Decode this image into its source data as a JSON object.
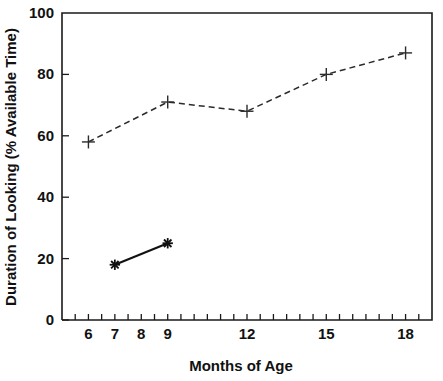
{
  "chart_data": {
    "type": "line",
    "title": "",
    "xlabel": "Months of Age",
    "ylabel": "Duration of Looking (% Available Time)",
    "xlim": [
      5,
      19
    ],
    "ylim": [
      0,
      100
    ],
    "grid": false,
    "legend": "none",
    "x_tick_labels": [
      "6",
      "7",
      "8",
      "9",
      "12",
      "15",
      "18"
    ],
    "x_tick_values": [
      6,
      7,
      8,
      9,
      12,
      15,
      18
    ],
    "x_minor_ticks": [
      5.5,
      6,
      6.5,
      7,
      7.5,
      8,
      8.5,
      9,
      9.5,
      10,
      10.5,
      11,
      11.5,
      12,
      12.5,
      13,
      13.5,
      14,
      14.5,
      15,
      15.5,
      16,
      16.5,
      17,
      17.5,
      18,
      18.5
    ],
    "y_tick_labels": [
      "0",
      "20",
      "40",
      "60",
      "80",
      "100"
    ],
    "y_tick_values": [
      0,
      20,
      40,
      60,
      80,
      100
    ],
    "series": [
      {
        "name": "dashed-series",
        "style": "dashed",
        "marker": "plus",
        "color": "#2b2b2b",
        "x": [
          6,
          9,
          12,
          15,
          18
        ],
        "values": [
          58,
          71,
          68,
          80,
          87
        ]
      },
      {
        "name": "solid-series",
        "style": "solid",
        "marker": "star",
        "color": "#111111",
        "x": [
          7,
          9
        ],
        "values": [
          18,
          25
        ]
      }
    ]
  },
  "axes": {
    "x_title": "Months of Age",
    "y_title": "Duration of Looking (% Available Time)"
  }
}
